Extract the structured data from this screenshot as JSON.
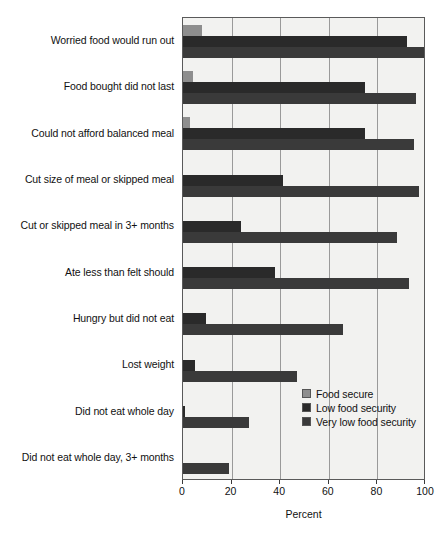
{
  "chart_data": {
    "type": "bar",
    "orientation": "horizontal",
    "title": "",
    "xlabel": "Percent",
    "ylabel": "",
    "xlim": [
      0,
      100
    ],
    "xticks": [
      0,
      20,
      40,
      60,
      80,
      100
    ],
    "grid": true,
    "legend_position": "inside-lower-right",
    "categories": [
      "Worried food would run out",
      "Food bought did not last",
      "Could not afford balanced meal",
      "Cut size of meal or skipped meal",
      "Cut or skipped meal in 3+ months",
      "Ate less than felt should",
      "Hungry but did not eat",
      "Lost weight",
      "Did not eat whole day",
      "Did not eat whole day, 3+ months"
    ],
    "series": [
      {
        "name": "Food secure",
        "color": "#8e8e8e",
        "values": [
          8,
          4,
          3,
          0,
          0,
          0,
          0,
          0,
          0,
          0
        ]
      },
      {
        "name": "Low food security",
        "color": "#2a2a2a",
        "values": [
          92,
          75,
          75,
          41,
          24,
          38,
          9.5,
          5,
          1,
          0
        ]
      },
      {
        "name": "Very low food security",
        "color": "#3a3a3a",
        "values": [
          99,
          96,
          95,
          97,
          88,
          93,
          66,
          47,
          27,
          19
        ]
      }
    ]
  },
  "axis": {
    "tick_labels": [
      "0",
      "20",
      "40",
      "60",
      "80",
      "100"
    ],
    "x_title": "Percent"
  },
  "legend": {
    "items": [
      {
        "label": "Food secure",
        "color": "#8e8e8e"
      },
      {
        "label": "Low food security",
        "color": "#2a2a2a"
      },
      {
        "label": "Very low food security",
        "color": "#3a3a3a"
      }
    ]
  }
}
